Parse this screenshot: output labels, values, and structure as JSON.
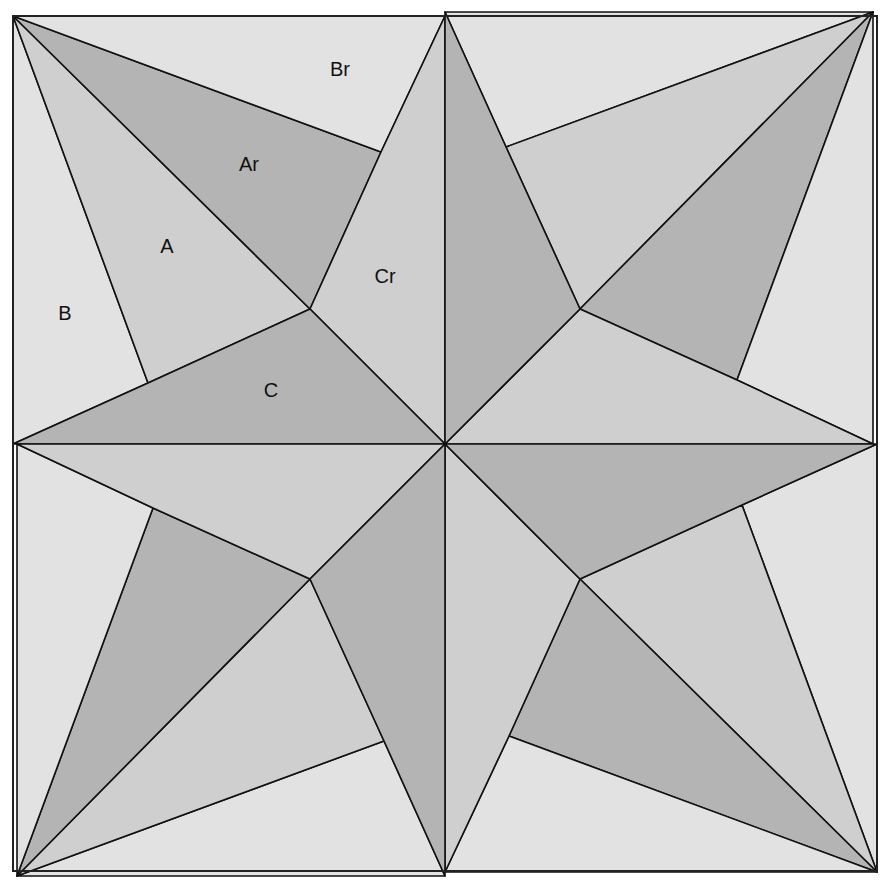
{
  "diagram": {
    "canvas": {
      "width": 893,
      "height": 884
    },
    "square": {
      "x1": 13,
      "y1": 16,
      "x2": 877,
      "y2": 871
    },
    "center": {
      "x": 445,
      "y": 444
    },
    "colors": {
      "light": "#e2e2e2",
      "medium": "#cfcfcf",
      "dark": "#b4b4b4",
      "stroke": "#111111"
    },
    "quadrant_template": {
      "note": "Top-left quadrant; other three quadrants are 90-degree rotations about the center",
      "pieces": [
        {
          "id": "B",
          "shade": "light",
          "points": [
            [
              13,
              16
            ],
            [
              148,
              383
            ],
            [
              13,
              444
            ]
          ]
        },
        {
          "id": "A",
          "shade": "medium",
          "points": [
            [
              13,
              16
            ],
            [
              310,
              309
            ],
            [
              148,
              383
            ]
          ]
        },
        {
          "id": "Ar",
          "shade": "dark",
          "points": [
            [
              13,
              16
            ],
            [
              381,
              152
            ],
            [
              310,
              309
            ]
          ]
        },
        {
          "id": "Br",
          "shade": "light",
          "points": [
            [
              13,
              16
            ],
            [
              445,
              16
            ],
            [
              381,
              152
            ]
          ]
        },
        {
          "id": "Cr",
          "shade": "medium",
          "points": [
            [
              445,
              16
            ],
            [
              445,
              444
            ],
            [
              310,
              309
            ],
            [
              381,
              152
            ]
          ]
        },
        {
          "id": "C",
          "shade": "dark",
          "points": [
            [
              13,
              444
            ],
            [
              445,
              444
            ],
            [
              310,
              309
            ],
            [
              148,
              383
            ]
          ]
        }
      ]
    },
    "labels": [
      {
        "text": "Br",
        "x": 340,
        "y": 71
      },
      {
        "text": "Ar",
        "x": 249,
        "y": 166
      },
      {
        "text": "A",
        "x": 167,
        "y": 248
      },
      {
        "text": "Cr",
        "x": 385,
        "y": 278
      },
      {
        "text": "B",
        "x": 65,
        "y": 315
      },
      {
        "text": "C",
        "x": 271,
        "y": 392
      }
    ]
  }
}
